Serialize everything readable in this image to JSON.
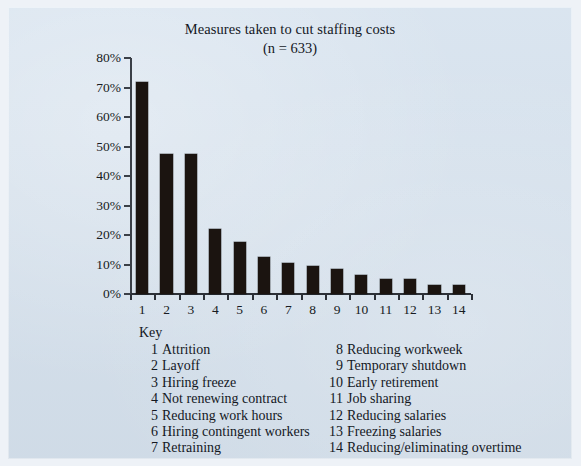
{
  "chart_data": {
    "type": "bar",
    "title": "Measures taken to cut staffing costs",
    "subtitle": "(n = 633)",
    "sample_size": "n = 633",
    "xlabel": "",
    "ylabel": "",
    "ylim": [
      0,
      80
    ],
    "ytick_labels": [
      "0%",
      "10%",
      "20%",
      "30%",
      "40%",
      "50%",
      "60%",
      "70%",
      "80%"
    ],
    "ytick_values": [
      0,
      10,
      20,
      30,
      40,
      50,
      60,
      70,
      80
    ],
    "grid": false,
    "legend_position": "below-plot",
    "categories": [
      "1",
      "2",
      "3",
      "4",
      "5",
      "6",
      "7",
      "8",
      "9",
      "10",
      "11",
      "12",
      "13",
      "14"
    ],
    "values": [
      72,
      47.5,
      47.5,
      22,
      17.5,
      12.5,
      10.5,
      9.5,
      8.5,
      6.5,
      5,
      5,
      3,
      3
    ],
    "bar_color": "#1b1410",
    "category_labels": [
      "Attrition",
      "Layoff",
      "Hiring freeze",
      "Not renewing contract",
      "Reducing work hours",
      "Hiring contingent workers",
      "Retraining",
      "Reducing workweek",
      "Temporary shutdown",
      "Early retirement",
      "Job sharing",
      "Reducing salaries",
      "Freezing salaries",
      "Reducing/eliminating overtime"
    ]
  },
  "key": {
    "heading": "Key",
    "left_column": [
      {
        "num": "1",
        "label": "Attrition"
      },
      {
        "num": "2",
        "label": "Layoff"
      },
      {
        "num": "3",
        "label": "Hiring freeze"
      },
      {
        "num": "4",
        "label": "Not renewing contract"
      },
      {
        "num": "5",
        "label": "Reducing work hours"
      },
      {
        "num": "6",
        "label": "Hiring contingent workers"
      },
      {
        "num": "7",
        "label": "Retraining"
      }
    ],
    "right_column": [
      {
        "num": "8",
        "label": "Reducing workweek"
      },
      {
        "num": "9",
        "label": "Temporary shutdown"
      },
      {
        "num": "10",
        "label": "Early retirement"
      },
      {
        "num": "11",
        "label": "Job sharing"
      },
      {
        "num": "12",
        "label": "Reducing salaries"
      },
      {
        "num": "13",
        "label": "Freezing salaries"
      },
      {
        "num": "14",
        "label": "Reducing/eliminating overtime"
      }
    ]
  },
  "colors": {
    "page_background": "#eef2f7",
    "panel_background": "#d6e2ee",
    "bar": "#1b1410",
    "axis": "#2c3037",
    "text": "#14181f"
  }
}
